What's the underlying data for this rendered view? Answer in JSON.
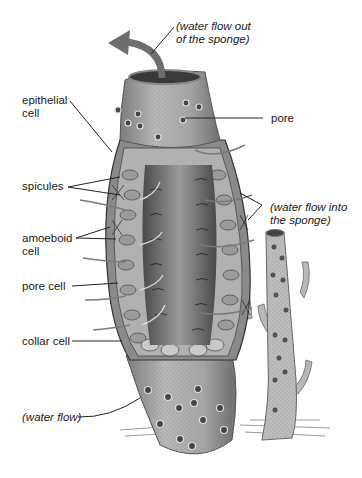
{
  "diagram": {
    "type": "labeled biological illustration",
    "labels": {
      "water_out": [
        "(water flow out",
        "of the sponge)"
      ],
      "epithelial": [
        "epithelial",
        "cell"
      ],
      "pore": "pore",
      "spicules": "spicules",
      "water_in": [
        "(water flow into",
        "the sponge)"
      ],
      "amoeboid": [
        "amoeboid",
        "cell"
      ],
      "pore_cell": "pore cell",
      "collar_cell": "collar cell",
      "water_flow": "(water flow)"
    },
    "colors": {
      "body": "#9c9c9c",
      "body_light": "#c9c9c9",
      "interior": "#6a6a6a",
      "arrow": "#6e6e6e",
      "text": "#1a1a1a",
      "leader": "#222222"
    }
  }
}
